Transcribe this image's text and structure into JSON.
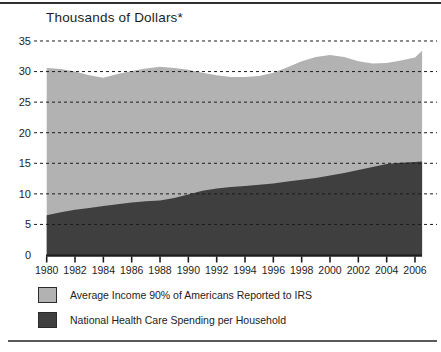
{
  "title": "Thousands of Dollars*",
  "legend": [
    {
      "label": "Average Income 90% of Americans Reported to IRS",
      "color": "#b2b2b2"
    },
    {
      "label": "National Health Care Spending per Household",
      "color": "#3f3f3f"
    }
  ],
  "colors": {
    "income_area": "#b2b2b2",
    "health_area": "#3f3f3f",
    "gridline": "#1c1c1c",
    "axis": "#1c1c1c",
    "text": "#1d1d1d"
  },
  "chart_data": {
    "type": "area",
    "title": "Thousands of Dollars*",
    "x": [
      1980,
      1981,
      1982,
      1983,
      1984,
      1985,
      1986,
      1987,
      1988,
      1989,
      1990,
      1991,
      1992,
      1993,
      1994,
      1995,
      1996,
      1997,
      1998,
      1999,
      2000,
      2001,
      2002,
      2003,
      2004,
      2005,
      2006,
      2006.5
    ],
    "series": [
      {
        "name": "Average Income 90% of Americans Reported to IRS",
        "color": "#b2b2b2",
        "values": [
          30.6,
          30.4,
          30.0,
          29.4,
          29.0,
          29.6,
          30.1,
          30.5,
          30.8,
          30.6,
          30.3,
          29.8,
          29.4,
          29.1,
          29.1,
          29.3,
          29.8,
          30.7,
          31.7,
          32.4,
          32.7,
          32.4,
          31.7,
          31.3,
          31.4,
          31.8,
          32.3,
          33.4
        ]
      },
      {
        "name": "National Health Care Spending per Household",
        "color": "#3f3f3f",
        "values": [
          6.5,
          7.0,
          7.4,
          7.7,
          8.0,
          8.3,
          8.6,
          8.8,
          8.9,
          9.3,
          9.9,
          10.5,
          10.9,
          11.1,
          11.3,
          11.5,
          11.7,
          12.0,
          12.3,
          12.6,
          13.0,
          13.4,
          13.9,
          14.4,
          14.9,
          15.1,
          15.2,
          15.3
        ]
      }
    ],
    "xticks": [
      1980,
      1982,
      1984,
      1986,
      1988,
      1990,
      1992,
      1994,
      1996,
      1998,
      2000,
      2002,
      2004,
      2006
    ],
    "yticks": [
      0,
      5,
      10,
      15,
      20,
      25,
      30,
      35
    ],
    "xlim": [
      1980,
      2006.5
    ],
    "ylim": [
      0,
      35
    ],
    "grid": "horizontal-dashed",
    "legend_position": "bottom-left",
    "xlabel": "",
    "ylabel": "Thousands of Dollars*"
  }
}
